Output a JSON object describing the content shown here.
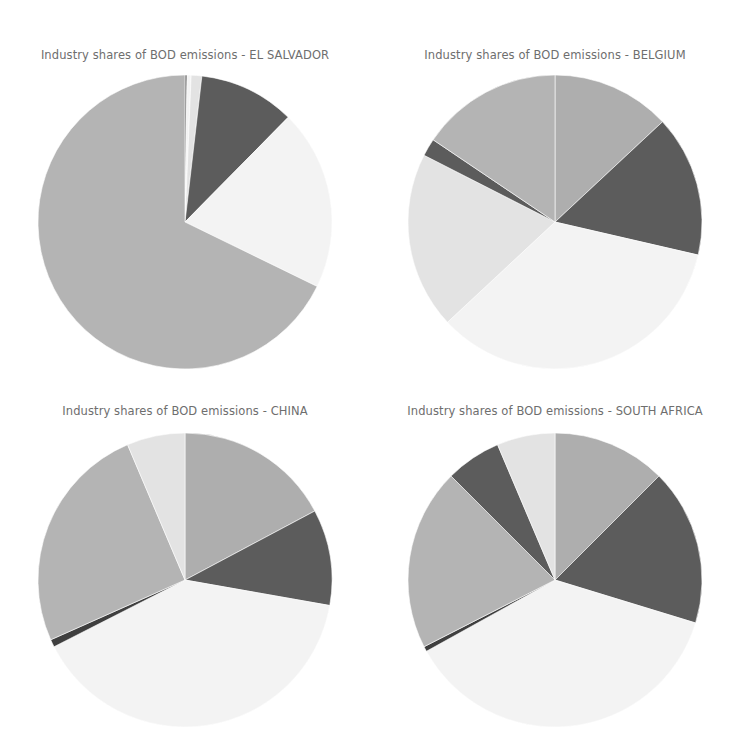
{
  "figure": {
    "title_prefix": "Industry shares of BOD emissions",
    "separator": "-",
    "background_color": "#ffffff",
    "title_color": "#6e6e6e"
  },
  "palette": {
    "medium_gray": "#aeaeae",
    "dark_gray": "#5c5c5c",
    "very_light_gray": "#f3f3f3",
    "light_gray": "#e3e3e3",
    "mid_gray": "#b4b4b4",
    "darkest_gray": "#3f3f3f"
  },
  "panels": [
    {
      "id": "el-salvador",
      "title": "Industry shares of BOD emissions - EL SALVADOR",
      "country": "EL SALVADOR",
      "row": 0,
      "column": 0
    },
    {
      "id": "belgium",
      "title": "Industry shares of BOD emissions - BELGIUM",
      "country": "BELGIUM",
      "row": 0,
      "column": 1
    },
    {
      "id": "china",
      "title": "Industry shares of BOD emissions - CHINA",
      "country": "CHINA",
      "row": 1,
      "column": 0
    },
    {
      "id": "south-africa",
      "title": "Industry shares of BOD emissions - SOUTH AFRICA",
      "country": "SOUTH AFRICA",
      "row": 1,
      "column": 1
    }
  ],
  "chart_data": [
    {
      "type": "pie",
      "title": "Industry shares of BOD emissions - EL SALVADOR",
      "xlabel": "",
      "ylabel": "",
      "legend": "none",
      "grid": false,
      "start_angle_deg": 0,
      "direction": "clockwise",
      "categories": [
        "slice-1",
        "slice-2",
        "slice-3",
        "slice-4",
        "slice-5",
        "slice-6"
      ],
      "values": [
        0.8,
        1.6,
        4.2,
        38.0,
        71.4,
        244.0
      ],
      "shares_pct": [
        0.2,
        0.4,
        1.2,
        10.6,
        19.8,
        67.8
      ],
      "angles_deg": [
        0.8,
        1.6,
        4.2,
        38.0,
        71.4,
        244.0
      ],
      "colors": [
        "#3f3f3f",
        "#f3f3f3",
        "#e3e3e3",
        "#5c5c5c",
        "#f3f3f3",
        "#b4b4b4"
      ]
    },
    {
      "type": "pie",
      "title": "Industry shares of BOD emissions - BELGIUM",
      "xlabel": "",
      "ylabel": "",
      "legend": "none",
      "grid": false,
      "start_angle_deg": 0,
      "direction": "clockwise",
      "categories": [
        "slice-1",
        "slice-2",
        "slice-3",
        "slice-4",
        "slice-5",
        "slice-6"
      ],
      "values": [
        47.0,
        56.0,
        124.0,
        70.0,
        7.0,
        56.0
      ],
      "shares_pct": [
        13.1,
        15.6,
        34.4,
        19.4,
        1.9,
        15.6
      ],
      "angles_deg": [
        47.0,
        56.0,
        124.0,
        70.0,
        7.0,
        56.0
      ],
      "colors": [
        "#aeaeae",
        "#5c5c5c",
        "#f3f3f3",
        "#e3e3e3",
        "#5c5c5c",
        "#b4b4b4"
      ]
    },
    {
      "type": "pie",
      "title": "Industry shares of BOD emissions - CHINA",
      "xlabel": "",
      "ylabel": "",
      "legend": "none",
      "grid": false,
      "start_angle_deg": 0,
      "direction": "clockwise",
      "categories": [
        "slice-1",
        "slice-2",
        "slice-3",
        "slice-4",
        "slice-5",
        "slice-6"
      ],
      "values": [
        62.0,
        38.0,
        143.0,
        3.0,
        91.0,
        23.0
      ],
      "shares_pct": [
        17.2,
        10.6,
        39.7,
        0.8,
        25.3,
        6.4
      ],
      "angles_deg": [
        62.0,
        38.0,
        143.0,
        3.0,
        91.0,
        23.0
      ],
      "colors": [
        "#aeaeae",
        "#5c5c5c",
        "#f3f3f3",
        "#3f3f3f",
        "#b4b4b4",
        "#e3e3e3"
      ]
    },
    {
      "type": "pie",
      "title": "Industry shares of BOD emissions - SOUTH AFRICA",
      "xlabel": "",
      "ylabel": "",
      "legend": "none",
      "grid": false,
      "start_angle_deg": 0,
      "direction": "clockwise",
      "categories": [
        "slice-1",
        "slice-2",
        "slice-3",
        "slice-4",
        "slice-5",
        "slice-6"
      ],
      "values": [
        45.0,
        62.0,
        134.0,
        2.0,
        72.0,
        22.0,
        23.0
      ],
      "shares_pct": [
        12.5,
        17.2,
        37.2,
        0.6,
        20.0,
        6.1,
        6.4
      ],
      "angles_deg": [
        45.0,
        62.0,
        134.0,
        2.0,
        72.0,
        22.0,
        23.0
      ],
      "colors": [
        "#aeaeae",
        "#5c5c5c",
        "#f3f3f3",
        "#3f3f3f",
        "#b4b4b4",
        "#5c5c5c",
        "#e3e3e3"
      ]
    }
  ]
}
